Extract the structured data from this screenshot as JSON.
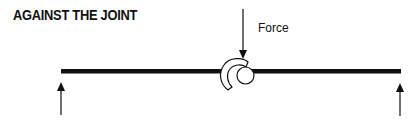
{
  "title": "AGAINST THE JOINT",
  "labels": {
    "force": "Force"
  },
  "icons": {
    "force_arrow": "arrow-down",
    "left_support": "arrow-up",
    "right_support": "arrow-up",
    "joint": "claw-and-ball-joint"
  },
  "colors": {
    "ink": "#111111",
    "background": "#ffffff"
  }
}
